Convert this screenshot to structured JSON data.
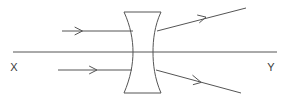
{
  "diagram": {
    "background_color": "#ffffff",
    "stroke_color": "#555555",
    "axis": {
      "name": "principal-axis",
      "label_left": "X",
      "label_right": "Y",
      "x_start": 13,
      "x_end": 277,
      "y": 52,
      "label_left_x": 14,
      "label_left_y": 71,
      "label_right_x": 271,
      "label_right_y": 71
    },
    "lens": {
      "type": "biconcave",
      "alias": "diverging-lens",
      "top_y": 12,
      "bottom_y": 93,
      "left_outer_x": 124,
      "right_outer_x": 161,
      "left_waist_x": 133,
      "right_waist_x": 153,
      "center_y": 52
    },
    "rays": [
      {
        "id": "incident-ray-upper",
        "label": "incident ray (upper)",
        "x1": 62,
        "y1": 31,
        "x2": 133,
        "y2": 31,
        "arrow_at_x": 81,
        "arrow_at_y": 31,
        "direction": "right"
      },
      {
        "id": "incident-ray-lower",
        "label": "incident ray (lower)",
        "x1": 58,
        "y1": 70,
        "x2": 132,
        "y2": 70,
        "arrow_at_x": 96,
        "arrow_at_y": 70,
        "direction": "right"
      },
      {
        "id": "refracted-ray-upper",
        "label": "refracted ray (diverging upward)",
        "x1": 157,
        "y1": 31,
        "x2": 246,
        "y2": 8,
        "arrow_at_x": 205,
        "arrow_at_y": 18.3,
        "direction": "up-right"
      },
      {
        "id": "refracted-ray-lower",
        "label": "refracted ray (diverging downward)",
        "x1": 156,
        "y1": 70,
        "x2": 241,
        "y2": 93,
        "arrow_at_x": 200,
        "arrow_at_y": 81.9,
        "direction": "down-right"
      }
    ]
  }
}
